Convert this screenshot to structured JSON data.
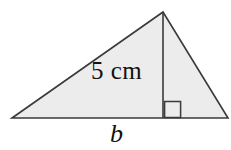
{
  "figure": {
    "name": "triangle-with-height-and-base",
    "background_color": "#ffffff",
    "fill_color": "#ececec",
    "stroke_color": "#3a3a3a",
    "text_color": "#111111",
    "labels": {
      "height_label": "5 cm",
      "base_label": "b"
    },
    "marks": {
      "right_angle_marker": "right-angle-square"
    },
    "geometry": {
      "apex": [
        163,
        12
      ],
      "bottom_left": [
        12,
        118
      ],
      "bottom_right": [
        228,
        118
      ],
      "height_foot": [
        163,
        118
      ],
      "right_angle_square": [
        164,
        101,
        17,
        17
      ]
    }
  }
}
